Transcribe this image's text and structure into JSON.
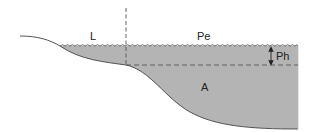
{
  "diagram": {
    "type": "lake cross-section zonation",
    "labels": {
      "littoral": "L",
      "pelagic": "Pe",
      "photic_depth": "Ph",
      "aphotic": "A"
    },
    "colors": {
      "water_fill": "#b4b4b4",
      "outline": "#444444",
      "dashed_line": "#555555",
      "background": "#ffffff"
    }
  }
}
